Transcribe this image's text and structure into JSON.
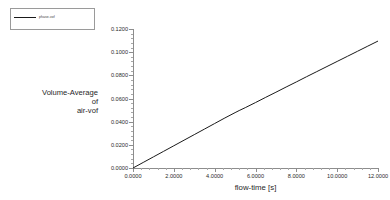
{
  "legend": {
    "label": "phase-vof",
    "swatch_color": "#1a1a1a"
  },
  "axis_titles": {
    "y_line1": "Volume-Average",
    "y_line2": "of",
    "y_line3": "air-vof",
    "x": "flow-time [s]"
  },
  "chart_data": {
    "type": "line",
    "title": "",
    "xlabel": "flow-time [s]",
    "ylabel": "Volume-Average of air-vof",
    "xlim": [
      0.0,
      12.0
    ],
    "ylim": [
      0.0,
      0.12
    ],
    "grid": false,
    "legend_position": "top-left-outside",
    "xticks": [
      0.0,
      2.0,
      4.0,
      6.0,
      8.0,
      10.0,
      12.0
    ],
    "xtick_labels": [
      "0.0000",
      "2.0000",
      "4.0000",
      "6.0000",
      "8.0000",
      "10.0000",
      "12.0000"
    ],
    "yticks": [
      0.0,
      0.02,
      0.04,
      0.06,
      0.08,
      0.1,
      0.12
    ],
    "ytick_labels": [
      "0.0000",
      "0.0200",
      "0.0400",
      "0.0600",
      "0.0800",
      "0.1000",
      "0.1200"
    ],
    "x_minor_per_interval": 4,
    "y_minor_per_interval": 4,
    "series": [
      {
        "name": "phase-vof",
        "color": "#1a1a1a",
        "x": [
          0.0,
          0.5,
          1.0,
          1.5,
          2.0,
          2.5,
          3.0,
          3.5,
          4.0,
          4.5,
          5.0,
          5.2,
          5.5,
          6.0,
          6.5,
          7.0,
          7.5,
          8.0,
          8.5,
          9.0,
          9.5,
          10.0,
          10.5,
          11.0,
          11.5,
          12.0
        ],
        "y": [
          0.0,
          0.0048,
          0.0096,
          0.0144,
          0.0192,
          0.024,
          0.0288,
          0.0336,
          0.0384,
          0.0432,
          0.0478,
          0.0496,
          0.0521,
          0.0565,
          0.061,
          0.0654,
          0.0699,
          0.0743,
          0.0788,
          0.0832,
          0.0876,
          0.092,
          0.0964,
          0.1008,
          0.1052,
          0.1096
        ]
      }
    ]
  }
}
